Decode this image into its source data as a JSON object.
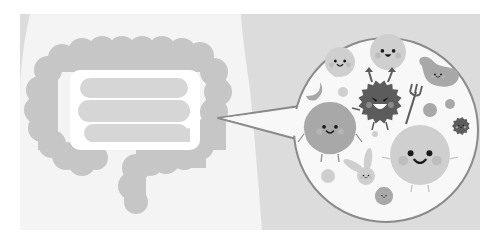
{
  "illustration": {
    "subject": "gut-microbiome",
    "width": 503,
    "height": 245,
    "colors": {
      "page_bg": "#ffffff",
      "panel_bg": "#dcdcdc",
      "body": "#f4f4f4",
      "colon": "#c6c6c6",
      "small_intestine": "#d6d6d6",
      "bubble_fill": "#f8f8f8",
      "bubble_stroke": "#8a8a8a",
      "bad_bacteria": "#5c5c5c",
      "good_mid": "#a8a8a8",
      "good_light": "#cfcfcf",
      "cheek": "#b8b8b8",
      "face": "#1a1a1a"
    },
    "panel": {
      "x": 20,
      "y": 14,
      "w": 460,
      "h": 216
    },
    "colon_lobes": [
      [
        62,
        58,
        14
      ],
      [
        82,
        52,
        14
      ],
      [
        102,
        50,
        14
      ],
      [
        122,
        50,
        14
      ],
      [
        142,
        50,
        14
      ],
      [
        162,
        50,
        14
      ],
      [
        182,
        52,
        14
      ],
      [
        200,
        56,
        14
      ],
      [
        48,
        70,
        14
      ],
      [
        40,
        90,
        14
      ],
      [
        38,
        110,
        14
      ],
      [
        42,
        128,
        14
      ],
      [
        52,
        144,
        14
      ],
      [
        66,
        156,
        14
      ],
      [
        82,
        162,
        14
      ],
      [
        96,
        158,
        12
      ],
      [
        214,
        72,
        14
      ],
      [
        218,
        92,
        14
      ],
      [
        214,
        112,
        14
      ],
      [
        210,
        130,
        14
      ],
      [
        200,
        146,
        14
      ],
      [
        184,
        156,
        14
      ],
      [
        166,
        160,
        14
      ],
      [
        150,
        162,
        14
      ],
      [
        136,
        168,
        14
      ],
      [
        132,
        186,
        14
      ],
      [
        136,
        202,
        12
      ]
    ],
    "intestine_bands": [
      {
        "x": 80,
        "y": 78,
        "w": 108,
        "h": 20
      },
      {
        "x": 78,
        "y": 100,
        "w": 112,
        "h": 22
      },
      {
        "x": 84,
        "y": 124,
        "w": 104,
        "h": 18
      }
    ],
    "bubble": {
      "cx": 386,
      "cy": 130,
      "r": 92,
      "tail": [
        [
          300,
          106
        ],
        [
          218,
          118
        ],
        [
          300,
          140
        ]
      ]
    },
    "bacteria": [
      {
        "name": "smiley-round-top",
        "shape": "circle",
        "cx": 388,
        "cy": 52,
        "r": 18,
        "fill": "good_light",
        "mood": "happy-open"
      },
      {
        "name": "smiley-round-left",
        "shape": "circle",
        "cx": 340,
        "cy": 62,
        "r": 15,
        "fill": "good_light",
        "mood": "smile"
      },
      {
        "name": "bean-bacteria",
        "shape": "bean",
        "cx": 436,
        "cy": 74,
        "fill": "good_mid",
        "mood": "smile"
      },
      {
        "name": "crescent-bacteria",
        "shape": "crescent",
        "cx": 314,
        "cy": 90,
        "fill": "good_mid"
      },
      {
        "name": "devil-bacteria",
        "shape": "spiky",
        "cx": 380,
        "cy": 102,
        "r": 22,
        "fill": "bad_bacteria",
        "mood": "evil"
      },
      {
        "name": "hexagon-bacteria",
        "shape": "blob",
        "cx": 330,
        "cy": 128,
        "r": 26,
        "fill": "good_mid",
        "mood": "smile"
      },
      {
        "name": "big-round-bacteria",
        "shape": "circle",
        "cx": 420,
        "cy": 155,
        "r": 30,
        "fill": "good_light",
        "mood": "smile"
      },
      {
        "name": "small-spiky-bacteria",
        "shape": "spiky",
        "cx": 461,
        "cy": 126,
        "r": 9,
        "fill": "bad_bacteria",
        "mood": "grin"
      },
      {
        "name": "bunny-bacteria",
        "shape": "bunny",
        "cx": 366,
        "cy": 176,
        "fill": "good_light",
        "mood": "smile"
      },
      {
        "name": "small-flower-bacteria",
        "shape": "blob",
        "cx": 384,
        "cy": 196,
        "r": 9,
        "fill": "good_mid",
        "mood": "smile"
      }
    ],
    "dots": [
      [
        343,
        92,
        5,
        "good_light"
      ],
      [
        430,
        110,
        7,
        "good_mid"
      ],
      [
        450,
        104,
        5,
        "good_mid"
      ],
      [
        375,
        134,
        3,
        "good_light"
      ],
      [
        328,
        176,
        7,
        "good_light"
      ],
      [
        336,
        74,
        3,
        "good_light"
      ],
      [
        374,
        170,
        0,
        "good_light"
      ]
    ]
  }
}
